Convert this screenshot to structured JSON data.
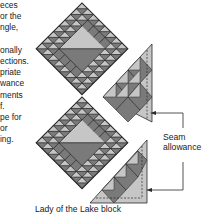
{
  "body_text": {
    "lines": [
      "eces",
      "or the",
      "ngle,",
      "",
      "onally",
      "ections.",
      "priate",
      "wance",
      "ments",
      "f.",
      "pe for",
      "or",
      "ing."
    ]
  },
  "diagram": {
    "title": "Lady of the Lake block",
    "annotation": {
      "line1": "Seam",
      "line2": "allowance"
    },
    "colors": {
      "dark": "#7a7a7a",
      "light": "#c6c6c6",
      "outline": "#2a2a2a",
      "background": "#ffffff"
    }
  }
}
